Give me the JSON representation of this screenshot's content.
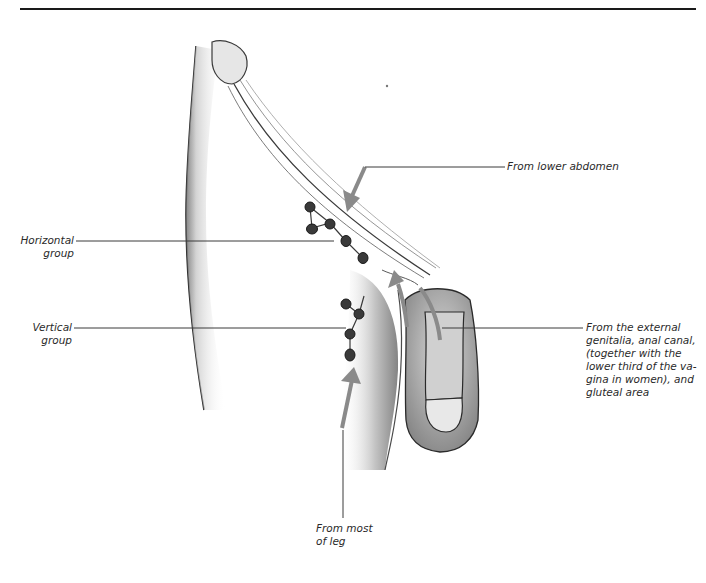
{
  "figure": {
    "colors": {
      "arrow": "#8a8a8a",
      "leader_line": "#3a3a3a",
      "text": "#2a2a2a",
      "node": "#3a3a3a",
      "skin_shade": "#9a9a9a"
    }
  },
  "labels": {
    "horizontal_group": {
      "line1": "Horizontal",
      "line2": "group"
    },
    "vertical_group": {
      "line1": "Vertical",
      "line2": "group"
    },
    "lower_abdomen": "From lower abdomen",
    "external_genitalia": {
      "line1": "From the external",
      "line2": "genitalia, anal canal,",
      "line3": "(together with the",
      "line4": "lower third of the va-",
      "line5": "gina in women), and",
      "line6": "gluteal area"
    },
    "most_of_leg": {
      "line1": "From most",
      "line2": "of leg"
    }
  }
}
